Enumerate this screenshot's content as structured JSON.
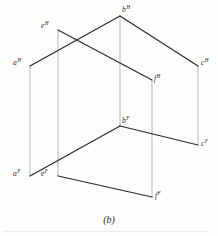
{
  "figure": {
    "caption": "(b)",
    "caption_x": 0,
    "caption_y": 214,
    "width": 218,
    "height": 236,
    "stroke_color": "#2b2b2b",
    "projector_color": "#9a9a9a",
    "background_color": "#fdfdfc"
  },
  "points": [
    {
      "id": "a-h",
      "label": "a",
      "superscript": "H",
      "x": 30,
      "y": 66,
      "label_x": 13,
      "label_y": 59
    },
    {
      "id": "b-h",
      "label": "b",
      "superscript": "H",
      "x": 120,
      "y": 16,
      "label_x": 122,
      "label_y": 6
    },
    {
      "id": "c-h",
      "label": "c",
      "superscript": "H",
      "x": 198,
      "y": 66,
      "label_x": 201,
      "label_y": 59
    },
    {
      "id": "e-h",
      "label": "e",
      "superscript": "H",
      "x": 58,
      "y": 30,
      "label_x": 41,
      "label_y": 22
    },
    {
      "id": "f-h",
      "label": "f",
      "superscript": "H",
      "x": 152,
      "y": 80,
      "label_x": 154,
      "label_y": 75
    },
    {
      "id": "a-f",
      "label": "a",
      "superscript": "F",
      "x": 30,
      "y": 176,
      "label_x": 13,
      "label_y": 170
    },
    {
      "id": "b-f",
      "label": "b",
      "superscript": "F",
      "x": 120,
      "y": 126,
      "label_x": 122,
      "label_y": 117
    },
    {
      "id": "c-f",
      "label": "c",
      "superscript": "F",
      "x": 198,
      "y": 145,
      "label_x": 201,
      "label_y": 140
    },
    {
      "id": "e-f",
      "label": "e",
      "superscript": "F",
      "x": 58,
      "y": 176,
      "label_x": 41,
      "label_y": 170
    },
    {
      "id": "f-f",
      "label": "f",
      "superscript": "F",
      "x": 152,
      "y": 197,
      "label_x": 155,
      "label_y": 192
    }
  ],
  "edges": [
    {
      "id": "edge-ah-bh",
      "from": "a-h",
      "to": "b-h",
      "kind": "object",
      "x1": 30,
      "y1": 66,
      "x2": 120,
      "y2": 16
    },
    {
      "id": "edge-bh-ch",
      "from": "b-h",
      "to": "c-h",
      "kind": "object",
      "x1": 120,
      "y1": 16,
      "x2": 198,
      "y2": 66
    },
    {
      "id": "edge-eh-fh",
      "from": "e-h",
      "to": "f-h",
      "kind": "object",
      "x1": 58,
      "y1": 30,
      "x2": 152,
      "y2": 80
    },
    {
      "id": "edge-af-bf",
      "from": "a-f",
      "to": "b-f",
      "kind": "object",
      "x1": 30,
      "y1": 176,
      "x2": 120,
      "y2": 126
    },
    {
      "id": "edge-bf-cf",
      "from": "b-f",
      "to": "c-f",
      "kind": "object",
      "x1": 120,
      "y1": 126,
      "x2": 198,
      "y2": 145
    },
    {
      "id": "edge-ef-ff",
      "from": "e-f",
      "to": "f-f",
      "kind": "object",
      "x1": 58,
      "y1": 176,
      "x2": 152,
      "y2": 197
    }
  ],
  "projectors": [
    {
      "id": "projector-a",
      "from": "a-h",
      "to": "a-f",
      "x1": 30,
      "y1": 66,
      "x2": 30,
      "y2": 176
    },
    {
      "id": "projector-e",
      "from": "e-h",
      "to": "e-f",
      "x1": 58,
      "y1": 30,
      "x2": 58,
      "y2": 176
    },
    {
      "id": "projector-b",
      "from": "b-h",
      "to": "b-f",
      "x1": 120,
      "y1": 16,
      "x2": 120,
      "y2": 126
    },
    {
      "id": "projector-f",
      "from": "f-h",
      "to": "f-f",
      "x1": 152,
      "y1": 80,
      "x2": 152,
      "y2": 197
    },
    {
      "id": "projector-c",
      "from": "c-h",
      "to": "c-f",
      "x1": 198,
      "y1": 66,
      "x2": 198,
      "y2": 145
    }
  ]
}
